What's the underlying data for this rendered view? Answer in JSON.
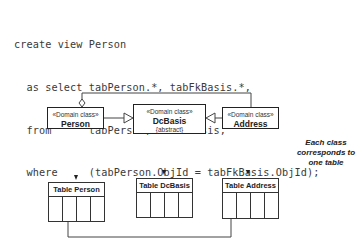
{
  "code": {
    "lines": [
      "create view Person",
      "  as select tabPerson.*, tabFkBasis.*,",
      "  from      tabPerson, tabFkBasis,",
      "  where     (tabPerson.ObjId = tabFkBasis.ObjId);"
    ]
  },
  "classes": [
    {
      "stereotype": "«Domain class»",
      "name": "Person",
      "extra": ""
    },
    {
      "stereotype": "«Domain class»",
      "name": "DcBasis",
      "extra": "{abstract}"
    },
    {
      "stereotype": "«Domain class»",
      "name": "Address",
      "extra": ""
    }
  ],
  "tables": [
    {
      "title": "Table Person"
    },
    {
      "title": "Table DcBasis"
    },
    {
      "title": "Table Address"
    }
  ],
  "note": "Each class corresponds to one table"
}
